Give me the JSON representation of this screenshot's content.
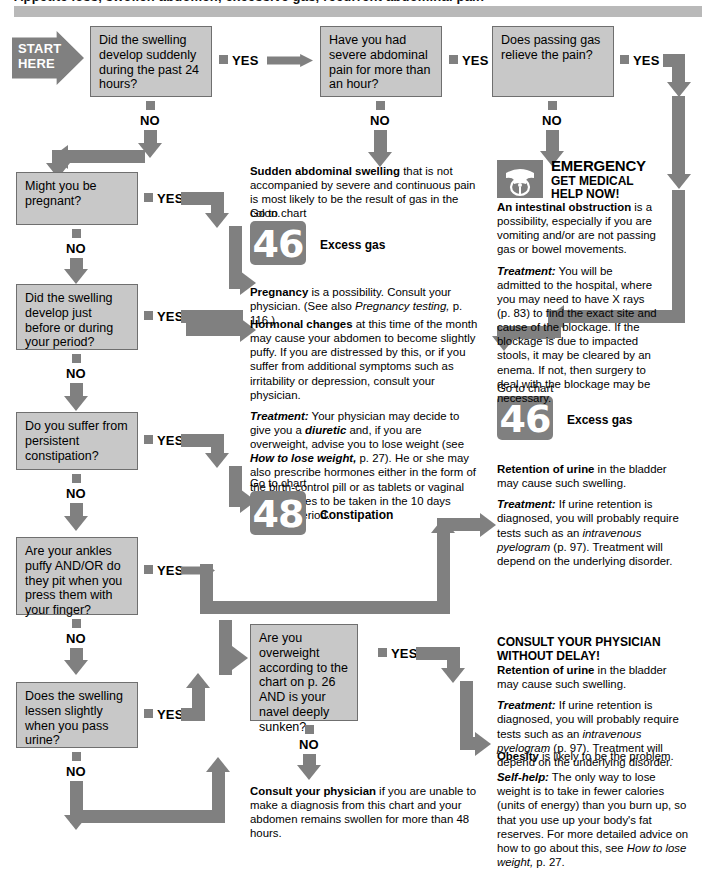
{
  "header": {
    "banner_text": "Appetite loss, swollen abdomen, excessive gas, recurrent abdominal pain"
  },
  "start": {
    "line1": "START",
    "line2": "HERE"
  },
  "labels": {
    "yes": "YES",
    "no": "NO",
    "go_to_chart": "Go to chart"
  },
  "questions": [
    {
      "id": "q1",
      "text": "Did the swelling develop suddenly during the past 24 hours?"
    },
    {
      "id": "q2",
      "text": "Have you had severe abdominal pain for more than an hour?"
    },
    {
      "id": "q3",
      "text": "Does passing gas relieve the pain?"
    },
    {
      "id": "q4",
      "text": "Might you be pregnant?"
    },
    {
      "id": "q5",
      "text": "Did the swelling develop just before or during your period?"
    },
    {
      "id": "q6",
      "text": "Do you suffer from persistent constipation?"
    },
    {
      "id": "q7",
      "text": "Are your ankles puffy AND/OR do they pit when you press them with your finger?"
    },
    {
      "id": "q8",
      "text": "Does the swelling lessen slightly when you pass urine?"
    },
    {
      "id": "q9",
      "text": "Are you overweight according to the chart on p. 26 AND is your navel deeply sunken?"
    }
  ],
  "outcomes": {
    "gas": {
      "lead": "Sudden abdominal swelling",
      "body": " that is not accompanied by severe and continuous pain is most likely to be the result of gas in the colon."
    },
    "pregnancy": {
      "lead": "Pregnancy",
      "body": " is a possibility. Consult your physician. (See also ",
      "italic": "Pregnancy testing,",
      "tail": " p. 116.)"
    },
    "hormonal": {
      "lead": "Hormonal changes",
      "body": " at this time of the month may cause your abdomen to become slightly puffy. If you are distressed by this, or if you suffer from additional symptoms such as irritability or depression, consult your physician.",
      "treat_lead": "Treatment:",
      "treat_1": " Your physician may decide to give you a ",
      "treat_i1": "diuretic",
      "treat_2": " and, if you are overweight, advise you to lose weight (see ",
      "treat_i2": "How to lose weight,",
      "treat_3": " p. 27). He or she may also prescribe hormones either in the form of the birth-control pill or as tablets or vaginal suppositories to be taken in the 10 days before a period."
    },
    "obstruction": {
      "emergency": "EMERGENCY",
      "sub_line1": "GET MEDICAL",
      "sub_line2": "HELP NOW!",
      "lead": "An intestinal obstruction",
      "body": " is a possibility, especially if you are vomiting and/or are not passing gas or bowel movements.",
      "treat_lead": "Treatment:",
      "treat_body": " You will be admitted to the hospital, where you may need to have X rays (p. 83) to find the exact site and cause of the blockage. If the blockage is due to impacted stools, it may be cleared by an enema. If not, then surgery to deal with the blockage may be necessary."
    },
    "urine_retention_upper": {
      "lead": "Retention of urine",
      "body": " in the bladder may cause such swelling.",
      "treat_lead": "Treatment:",
      "treat_1": " If urine retention is diagnosed, you will probably require tests such as an ",
      "treat_i1": "intravenous pyelogram",
      "treat_2": " (p. 97). Treatment will depend on the underlying disorder."
    },
    "urine_retention_lower": {
      "head_line1": "CONSULT YOUR PHYSICIAN",
      "head_line2": "WITHOUT DELAY!",
      "lead": "Retention of urine",
      "body": " in the bladder may cause such swelling.",
      "treat_lead": "Treatment:",
      "treat_1": " If urine retention is diagnosed, you will probably require tests such as an ",
      "treat_i1": "intravenous pyelogram",
      "treat_2": " (p. 97). Treatment will depend on the underlying disorder."
    },
    "obesity": {
      "lead": "Obesity",
      "body": " is likely to be the problem.",
      "self_lead": "Self-help:",
      "self_1": " The only way to lose weight is to take in fewer calories (units of energy) than you burn up, so that you use up your body's fat reserves. For more detailed advice on how to go about this, see ",
      "self_i1": "How to lose weight,",
      "self_2": " p. 27."
    },
    "final": {
      "lead": "Consult your physician",
      "body": " if you are unable to make a diagnosis from this chart and your abdomen remains swollen for more than 48 hours."
    }
  },
  "chart_refs": [
    {
      "id": "ref46a",
      "number": "46",
      "label": "Excess gas"
    },
    {
      "id": "ref48",
      "number": "48",
      "label": "Constipation"
    },
    {
      "id": "ref46b",
      "number": "46",
      "label": "Excess gas"
    }
  ],
  "colors": {
    "box_fill": "#c8c8c8",
    "box_border": "#6f6f6f",
    "connector": "#808080",
    "banner": "#b9b9b9",
    "text": "#000000"
  }
}
